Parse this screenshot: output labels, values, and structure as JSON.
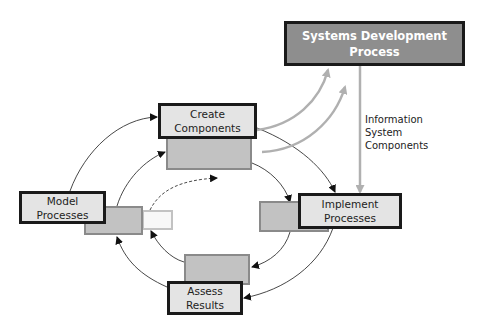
{
  "diagram": {
    "type": "process-cycle",
    "nodes": {
      "sdp": {
        "line1": "Systems Development",
        "line2": "Process"
      },
      "create": {
        "line1": "Create",
        "line2": "Components"
      },
      "model": {
        "line1": "Model",
        "line2": "Processes"
      },
      "implement": {
        "line1": "Implement",
        "line2": "Processes"
      },
      "assess": {
        "line1": "Assess",
        "line2": "Results"
      }
    },
    "edge_label": {
      "line1": "Information",
      "line2": "System",
      "line3": "Components"
    },
    "colors": {
      "sdp_fill": "#8e8e8e",
      "main_fill": "#e4e4e4",
      "shadow_fill": "#c2c2c2",
      "feed_arrow": "#b0b0b0",
      "cycle_arrow": "#333333"
    }
  }
}
